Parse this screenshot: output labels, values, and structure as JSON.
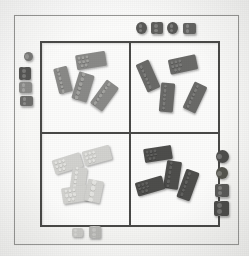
{
  "scene": {
    "description": "Photograph of a square sorting tray divided into four quadrants, each holding LEGO-style bricks grouped by shade, with loose unsorted pieces scattered on the white surface around the tray.",
    "background_color": "#fdfdfc",
    "frame_color": "#9a9a98",
    "tray_border_color": "#4a4a48",
    "tray_fill_color": "#fcfcfb"
  },
  "tray": {
    "label": "sorting-tray",
    "rows": 2,
    "columns": 2,
    "quadrants": [
      {
        "id": "top-left",
        "label": "medium gray bricks",
        "shade_class": "sh-mid",
        "color": "#8a8a88",
        "count": 4,
        "bricks": [
          {
            "name": "brick-tl-1",
            "left": 14,
            "top": 24,
            "width": 14,
            "height": 26,
            "rotate": -14,
            "studs": 6,
            "cols": 2
          },
          {
            "name": "brick-tl-2",
            "left": 34,
            "top": 10,
            "width": 30,
            "height": 15,
            "rotate": -9,
            "studs": 8,
            "cols": 4
          },
          {
            "name": "brick-tl-3",
            "left": 33,
            "top": 30,
            "width": 16,
            "height": 28,
            "rotate": 17,
            "studs": 6,
            "cols": 2
          },
          {
            "name": "brick-tl-4",
            "left": 55,
            "top": 38,
            "width": 15,
            "height": 29,
            "rotate": 36,
            "studs": 6,
            "cols": 2
          }
        ]
      },
      {
        "id": "top-right",
        "label": "dark gray bricks",
        "shade_class": "sh-dark",
        "color": "#6a6a68",
        "count": 4,
        "bricks": [
          {
            "name": "brick-tr-1",
            "left": 10,
            "top": 18,
            "width": 14,
            "height": 30,
            "rotate": -24,
            "studs": 6,
            "cols": 2
          },
          {
            "name": "brick-tr-2",
            "left": 38,
            "top": 14,
            "width": 28,
            "height": 15,
            "rotate": -12,
            "studs": 8,
            "cols": 4
          },
          {
            "name": "brick-tr-3",
            "left": 29,
            "top": 40,
            "width": 14,
            "height": 29,
            "rotate": 5,
            "studs": 6,
            "cols": 2
          },
          {
            "name": "brick-tr-4",
            "left": 57,
            "top": 40,
            "width": 14,
            "height": 29,
            "rotate": 25,
            "studs": 6,
            "cols": 2
          }
        ]
      },
      {
        "id": "bottom-left",
        "label": "light gray bricks",
        "shade_class": "sh-light",
        "color": "#d2d2cf",
        "count": 5,
        "bricks": [
          {
            "name": "brick-bl-1",
            "left": 11,
            "top": 22,
            "width": 29,
            "height": 15,
            "rotate": -17,
            "studs": 8,
            "cols": 4
          },
          {
            "name": "brick-bl-2",
            "left": 41,
            "top": 14,
            "width": 28,
            "height": 15,
            "rotate": -15,
            "studs": 8,
            "cols": 4
          },
          {
            "name": "brick-bl-3",
            "left": 29,
            "top": 33,
            "width": 15,
            "height": 26,
            "rotate": 8,
            "studs": 6,
            "cols": 2
          },
          {
            "name": "brick-bl-4",
            "left": 20,
            "top": 52,
            "width": 31,
            "height": 16,
            "rotate": -9,
            "studs": 8,
            "cols": 4
          },
          {
            "name": "brick-bl-5",
            "left": 44,
            "top": 46,
            "width": 16,
            "height": 22,
            "rotate": 12,
            "studs": 4,
            "cols": 2
          }
        ]
      },
      {
        "id": "bottom-right",
        "label": "black bricks",
        "shade_class": "sh-darkest",
        "color": "#4e4e4c",
        "count": 4,
        "bricks": [
          {
            "name": "brick-br-1",
            "left": 13,
            "top": 13,
            "width": 28,
            "height": 14,
            "rotate": -9,
            "studs": 8,
            "cols": 4
          },
          {
            "name": "brick-br-2",
            "left": 34,
            "top": 27,
            "width": 15,
            "height": 28,
            "rotate": 9,
            "studs": 6,
            "cols": 2
          },
          {
            "name": "brick-br-3",
            "left": 5,
            "top": 45,
            "width": 28,
            "height": 14,
            "rotate": -16,
            "studs": 8,
            "cols": 4
          },
          {
            "name": "brick-br-4",
            "left": 50,
            "top": 36,
            "width": 14,
            "height": 30,
            "rotate": 20,
            "studs": 6,
            "cols": 2
          }
        ]
      }
    ]
  },
  "loose_pieces": {
    "label": "unsorted pieces outside the tray",
    "groups": [
      {
        "id": "top-edge",
        "label": "dark pieces above the tray",
        "count": 4,
        "pieces": [
          {
            "name": "loose-top-1",
            "shape": "round",
            "left": 136,
            "top": 22,
            "width": 11,
            "height": 12,
            "color": "#5a5a58",
            "studs": 2,
            "cols": 2
          },
          {
            "name": "loose-top-2",
            "shape": "square",
            "left": 151,
            "top": 22,
            "width": 12,
            "height": 12,
            "color": "#5f5f5d",
            "studs": 4,
            "cols": 2
          },
          {
            "name": "loose-top-3",
            "shape": "round",
            "left": 167,
            "top": 22,
            "width": 11,
            "height": 12,
            "color": "#5a5a58",
            "studs": 2,
            "cols": 2
          },
          {
            "name": "loose-top-4",
            "shape": "square",
            "left": 183,
            "top": 23,
            "width": 13,
            "height": 11,
            "color": "#656563",
            "studs": 4,
            "cols": 2
          }
        ]
      },
      {
        "id": "left-edge",
        "label": "pieces left of the tray",
        "count": 4,
        "pieces": [
          {
            "name": "loose-left-1",
            "shape": "round",
            "left": 24,
            "top": 52,
            "width": 9,
            "height": 9,
            "color": "#7a7a78",
            "studs": 1,
            "cols": 1
          },
          {
            "name": "loose-left-2",
            "shape": "square",
            "left": 19,
            "top": 67,
            "width": 12,
            "height": 13,
            "color": "#565654",
            "studs": 4,
            "cols": 2
          },
          {
            "name": "loose-left-3",
            "shape": "square",
            "left": 19,
            "top": 82,
            "width": 13,
            "height": 11,
            "color": "#8c8c8a",
            "studs": 4,
            "cols": 2
          },
          {
            "name": "loose-left-4",
            "shape": "square",
            "left": 20,
            "top": 96,
            "width": 13,
            "height": 10,
            "color": "#6e6e6c",
            "studs": 4,
            "cols": 2
          }
        ]
      },
      {
        "id": "right-edge",
        "label": "pieces right of the tray",
        "count": 4,
        "pieces": [
          {
            "name": "loose-right-1",
            "shape": "round",
            "left": 216,
            "top": 150,
            "width": 13,
            "height": 13,
            "color": "#4f4f4d",
            "studs": 1,
            "cols": 1
          },
          {
            "name": "loose-right-2",
            "shape": "round",
            "left": 216,
            "top": 167,
            "width": 12,
            "height": 12,
            "color": "#56564f",
            "studs": 1,
            "cols": 1
          },
          {
            "name": "loose-right-3",
            "shape": "square",
            "left": 215,
            "top": 184,
            "width": 14,
            "height": 13,
            "color": "#5b5b59",
            "studs": 4,
            "cols": 2
          },
          {
            "name": "loose-right-4",
            "shape": "square",
            "left": 214,
            "top": 201,
            "width": 15,
            "height": 15,
            "color": "#4d4d4b",
            "studs": 4,
            "cols": 2
          }
        ]
      },
      {
        "id": "bottom-edge",
        "label": "light pieces below the tray",
        "count": 2,
        "pieces": [
          {
            "name": "loose-bottom-1",
            "shape": "square",
            "left": 72,
            "top": 228,
            "width": 11,
            "height": 9,
            "color": "#c9c9c6",
            "studs": 4,
            "cols": 2
          },
          {
            "name": "loose-bottom-2",
            "shape": "square",
            "left": 89,
            "top": 226,
            "width": 12,
            "height": 12,
            "color": "#b6b6b3",
            "studs": 4,
            "cols": 2
          }
        ]
      }
    ]
  }
}
